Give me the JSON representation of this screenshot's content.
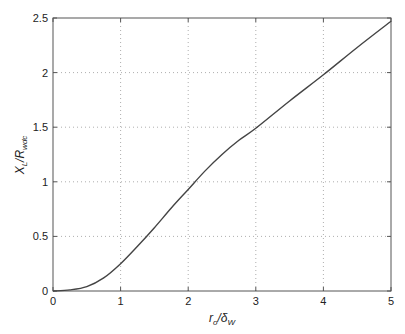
{
  "chart_data": {
    "type": "line",
    "title": "",
    "xlabel": "r_o/δ_W",
    "ylabel": "X_L/R_wdc",
    "xlabel_parts": {
      "main": "r",
      "sub1": "o",
      "mid": "/δ",
      "sub2": "W"
    },
    "ylabel_parts": {
      "main": "X",
      "sub1": "L",
      "mid": "/R",
      "sub2": "wdc"
    },
    "xlim": [
      0,
      5
    ],
    "ylim": [
      0,
      2.5
    ],
    "x_ticks": [
      "0",
      "1",
      "2",
      "3",
      "4",
      "5"
    ],
    "y_ticks": [
      "0",
      "0.5",
      "1",
      "1.5",
      "2",
      "2.5"
    ],
    "grid": true,
    "legend": null,
    "series": [
      {
        "name": "X_L/R_wdc",
        "color": "#444444",
        "x": [
          0,
          0.25,
          0.5,
          0.75,
          1.0,
          1.25,
          1.5,
          1.75,
          2.0,
          2.25,
          2.5,
          2.75,
          3.0,
          3.5,
          4.0,
          4.5,
          5.0
        ],
        "y": [
          0,
          0.01,
          0.04,
          0.12,
          0.25,
          0.41,
          0.58,
          0.76,
          0.93,
          1.1,
          1.25,
          1.38,
          1.49,
          1.74,
          1.98,
          2.23,
          2.47
        ]
      }
    ]
  }
}
